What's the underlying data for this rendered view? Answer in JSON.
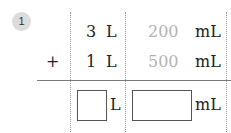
{
  "problem": {
    "number": "1",
    "operator": "+",
    "rows": [
      {
        "liters": "3",
        "liter_unit": "L",
        "milliliters": "200",
        "ml_unit": "mL"
      },
      {
        "liters": "1",
        "liter_unit": "L",
        "milliliters": "500",
        "ml_unit": "mL"
      }
    ],
    "answer": {
      "liters_value": "",
      "liter_unit": "L",
      "milliliters_value": "",
      "ml_unit": "mL"
    }
  },
  "colors": {
    "badge_bg": "#dcdcdc",
    "gray_digits": "#b3b3b3",
    "text": "#222222"
  }
}
